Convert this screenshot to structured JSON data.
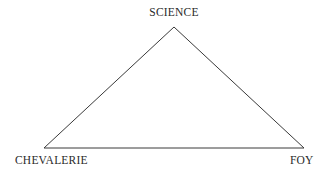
{
  "diagram": {
    "type": "triangle",
    "vertices": {
      "top": {
        "label": "SCIENCE"
      },
      "bottom_left": {
        "label": "CHEVALERIE"
      },
      "bottom_right": {
        "label": "FOY"
      }
    },
    "line_color": "#3a3a3a",
    "background": "#ffffff"
  }
}
